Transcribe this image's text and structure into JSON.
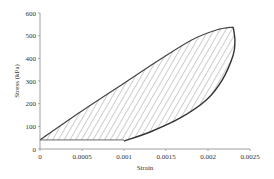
{
  "chart_data": {
    "type": "line",
    "title": "",
    "xlabel": "Strain",
    "ylabel": "Stress (kPa)",
    "xlim": [
      0,
      0.0025
    ],
    "ylim": [
      0,
      600
    ],
    "x_ticks": [
      "0",
      "0.0005",
      "0.001",
      "0.0015",
      "0.002",
      "0.0025"
    ],
    "y_ticks": [
      "0",
      "100",
      "200",
      "300",
      "400",
      "500",
      "600"
    ],
    "grid": false,
    "legend": null,
    "fill": "hatched area enclosed by hysteresis loop and horizontal baseline",
    "series": [
      {
        "name": "loading",
        "x": [
          0,
          0.00048,
          0.001,
          0.0014,
          0.0018,
          0.0021,
          0.0023
        ],
        "y": [
          40,
          163,
          290,
          388,
          480,
          525,
          538
        ]
      },
      {
        "name": "unloading",
        "x": [
          0.0023,
          0.00232,
          0.0023,
          0.00217,
          0.00198,
          0.00167,
          0.00131,
          0.001
        ],
        "y": [
          538,
          480,
          415,
          305,
          216,
          137,
          75,
          35
        ]
      },
      {
        "name": "baseline",
        "x": [
          0,
          0.001
        ],
        "y": [
          40,
          40
        ]
      }
    ]
  }
}
